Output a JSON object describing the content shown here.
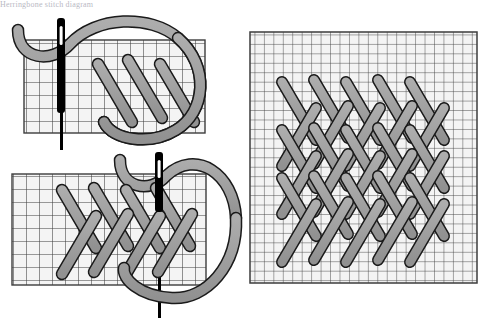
{
  "document": {
    "title": "Herringbone stitch worked over a grid",
    "cropped_header_text": "Herringbone stitch diagram",
    "background_color": "#ffffff"
  },
  "palette": {
    "thread_fill": "#a0a0a0",
    "thread_stroke": "#1a1a1a",
    "needle_fill": "#000000",
    "grid_line": "#3d3d3d",
    "grid_cell_fill": "#f4f4f4",
    "canvas_fill": "#fbfbfb",
    "caption_text": "#b9b9c4"
  },
  "figures": [
    {
      "id": "figure-top-left",
      "name": "first-journey-left-to-right",
      "description": "Needle passing up through the fabric at the start of a herringbone row, thread loop curving over the grid",
      "grid": {
        "x": 24,
        "y": 40,
        "width": 181,
        "height": 93,
        "columns": 14,
        "rows": 7,
        "cell_size": 13
      },
      "needle": {
        "x": 62,
        "y": 18,
        "length": 116,
        "width": 7,
        "eye": true
      },
      "stitches": [
        {
          "x1": 98,
          "y1": 64,
          "x2": 132,
          "y2": 122
        },
        {
          "x1": 128,
          "y1": 60,
          "x2": 162,
          "y2": 118
        },
        {
          "x1": 158,
          "y1": 64,
          "x2": 192,
          "y2": 122
        }
      ],
      "thread_loop": {
        "center_x": 146,
        "center_y": 86,
        "radius_x": 56,
        "radius_y": 62
      }
    },
    {
      "id": "figure-bottom-left",
      "name": "second-journey-return",
      "description": "Return journey of the herringbone row with completed crossed stitches and the needle re-entering the fabric",
      "grid": {
        "x": 12,
        "y": 174,
        "width": 194,
        "height": 111,
        "columns": 15,
        "rows": 8,
        "cell_size": 13
      },
      "needle": {
        "x": 160,
        "y": 152,
        "length": 136,
        "width": 7,
        "eye": true
      },
      "stitches": [
        {
          "x1": 62,
          "y1": 190,
          "x2": 96,
          "y2": 248
        },
        {
          "x1": 92,
          "y1": 188,
          "x2": 126,
          "y2": 246
        },
        {
          "x1": 124,
          "y1": 190,
          "x2": 158,
          "y2": 248
        },
        {
          "x1": 96,
          "y1": 216,
          "x2": 62,
          "y2": 274
        },
        {
          "x1": 128,
          "y1": 214,
          "x2": 94,
          "y2": 272
        },
        {
          "x1": 160,
          "y1": 216,
          "x2": 126,
          "y2": 274
        },
        {
          "x1": 154,
          "y1": 188,
          "x2": 188,
          "y2": 246
        },
        {
          "x1": 190,
          "y1": 214,
          "x2": 156,
          "y2": 272
        }
      ],
      "thread_loop": {
        "center_x": 190,
        "center_y": 220,
        "radius_x": 56,
        "radius_y": 62
      }
    },
    {
      "id": "figure-right",
      "name": "completed-herringbone-band",
      "description": "Finished block of interlocking herringbone stitches worked across the full grid",
      "grid": {
        "x": 250,
        "y": 32,
        "width": 227,
        "height": 251,
        "columns": 24,
        "rows": 26,
        "cell_size": 9.45
      },
      "pattern": {
        "rows": 3,
        "columns": 5,
        "stitch_length": 64,
        "row_pitch": 48,
        "column_pitch": 32,
        "origin_x": 282,
        "origin_y": 82,
        "directions": [
          "down-right",
          "down-left"
        ]
      }
    }
  ]
}
